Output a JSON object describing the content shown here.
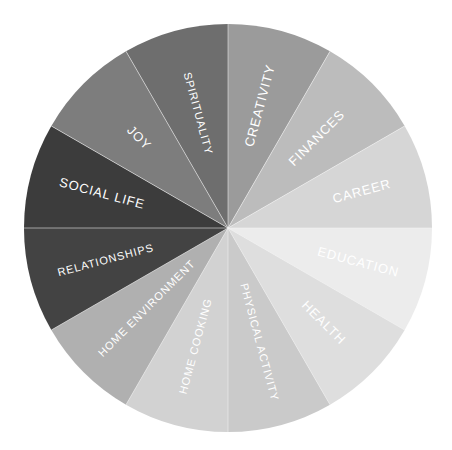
{
  "chart_data": {
    "type": "pie",
    "title": "",
    "subtitle": "",
    "xlabel": "",
    "ylabel": "",
    "legend_position": "none",
    "grid": false,
    "equal_slices": true,
    "slice_angle_deg": 30,
    "start_angle_deg": -90,
    "center": {
      "cx": 228,
      "cy": 228
    },
    "radius": 204,
    "categories": [
      "CREATIVITY",
      "FINANCES",
      "CAREER",
      "EDUCATION",
      "HEALTH",
      "PHYSICAL ACTIVITY",
      "HOME COOKING",
      "HOME ENVIRONMENT",
      "RELATIONSHIPS",
      "SOCIAL LIFE",
      "JOY",
      "SPIRITUALITY"
    ],
    "values": [
      8.3333,
      8.3333,
      8.3333,
      8.3333,
      8.3333,
      8.3333,
      8.3333,
      8.3333,
      8.3333,
      8.3333,
      8.3333,
      8.3333
    ],
    "colors": [
      "#9b9b9b",
      "#bcbcbc",
      "#d6d6d6",
      "#ececec",
      "#dedede",
      "#cacaca",
      "#d2d2d2",
      "#b0b0b0",
      "#434343",
      "#3c3c3c",
      "#7d7d7d",
      "#6e6e6e"
    ],
    "slices": [
      {
        "label": "CREATIVITY",
        "value": 8.3333,
        "color": "#9b9b9b",
        "start_deg": -90,
        "end_deg": -60,
        "mid_deg": -75,
        "label_radius": 0.62,
        "text_side": "outward"
      },
      {
        "label": "FINANCES",
        "value": 8.3333,
        "color": "#bcbcbc",
        "start_deg": -60,
        "end_deg": -30,
        "mid_deg": -45,
        "label_radius": 0.62,
        "text_side": "outward"
      },
      {
        "label": "CAREER",
        "value": 8.3333,
        "color": "#d6d6d6",
        "start_deg": -30,
        "end_deg": 0,
        "mid_deg": -15,
        "label_radius": 0.68,
        "text_side": "outward"
      },
      {
        "label": "EDUCATION",
        "value": 8.3333,
        "color": "#ececec",
        "start_deg": 0,
        "end_deg": 30,
        "mid_deg": 15,
        "label_radius": 0.66,
        "text_side": "outward"
      },
      {
        "label": "HEALTH",
        "value": 8.3333,
        "color": "#dedede",
        "start_deg": 30,
        "end_deg": 60,
        "mid_deg": 45,
        "label_radius": 0.66,
        "text_side": "outward"
      },
      {
        "label": "PHYSICAL ACTIVITY",
        "value": 8.3333,
        "color": "#cacaca",
        "start_deg": 60,
        "end_deg": 90,
        "mid_deg": 75,
        "label_radius": 0.58,
        "text_side": "outward"
      },
      {
        "label": "HOME COOKING",
        "value": 8.3333,
        "color": "#d2d2d2",
        "start_deg": 90,
        "end_deg": 120,
        "mid_deg": 105,
        "label_radius": 0.6,
        "text_side": "outward"
      },
      {
        "label": "HOME ENVIRONMENT",
        "value": 8.3333,
        "color": "#b0b0b0",
        "start_deg": 120,
        "end_deg": 150,
        "mid_deg": 135,
        "label_radius": 0.56,
        "text_side": "outward"
      },
      {
        "label": "RELATIONSHIPS",
        "value": 8.3333,
        "color": "#434343",
        "start_deg": 150,
        "end_deg": 180,
        "mid_deg": 165,
        "label_radius": 0.62,
        "text_side": "outward"
      },
      {
        "label": "SOCIAL LIFE",
        "value": 8.3333,
        "color": "#3c3c3c",
        "start_deg": 180,
        "end_deg": 210,
        "mid_deg": 195,
        "label_radius": 0.64,
        "text_side": "outward"
      },
      {
        "label": "JOY",
        "value": 8.3333,
        "color": "#7d7d7d",
        "start_deg": 210,
        "end_deg": 240,
        "mid_deg": 225,
        "label_radius": 0.62,
        "text_side": "outward"
      },
      {
        "label": "SPIRITUALITY",
        "value": 8.3333,
        "color": "#6e6e6e",
        "start_deg": 240,
        "end_deg": 270,
        "mid_deg": 255,
        "label_radius": 0.58,
        "text_side": "outward"
      }
    ],
    "annotations": []
  },
  "style": {
    "background_color": "#ffffff",
    "label_color": "#ffffff",
    "divider_color": "#f2f2f2",
    "label_font_size": 13,
    "label_font_size_long": 11
  }
}
